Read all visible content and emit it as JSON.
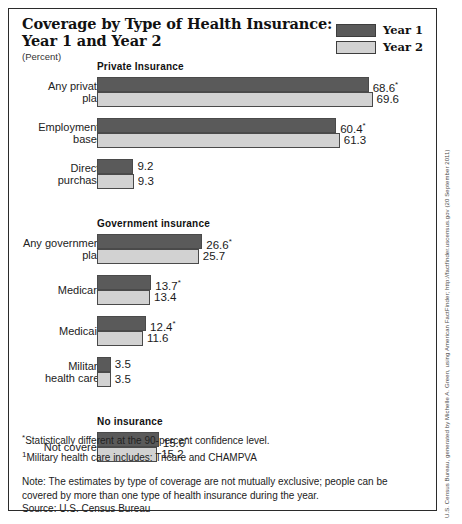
{
  "header": {
    "title_line1": "Coverage by Type of Health Insurance:",
    "title_line2": "Year 1 and Year 2",
    "subtitle": "(Percent)",
    "legend": [
      {
        "label": "Year 1",
        "color": "#5a5a5a"
      },
      {
        "label": "Year 2",
        "color": "#d2d2d2"
      }
    ]
  },
  "footnotes": [
    {
      "mark": "*",
      "text": "Statistically different at the 90-percent confidence level."
    },
    {
      "mark": "1",
      "text": "Military health care includes: Tricare and CHAMPVA"
    }
  ],
  "notes": {
    "note": "Note:  The estimates by type of coverage are not mutually exclusive; people can be covered by more than one type of health insurance during the year.",
    "source": "Source: U.S. Census Bureau"
  },
  "credit": "U.S. Census Bureau, generated by Michelle A. Green, using American FactFinder; http://factfinder.uscensus.gov (20 September 2011)",
  "chart_data": {
    "type": "bar",
    "title": "Coverage by Type of Health Insurance: Year 1 and Year 2",
    "subtitle": "(Percent)",
    "orientation": "horizontal",
    "xlabel": "Percent",
    "ylabel": "",
    "xlim": [
      0,
      70
    ],
    "grid": false,
    "legend_position": "top-right",
    "series": [
      {
        "name": "Year 1",
        "color": "#5a5a5a"
      },
      {
        "name": "Year 2",
        "color": "#d2d2d2"
      }
    ],
    "groups": [
      {
        "name": "Private Insurance",
        "categories": [
          {
            "label_lines": [
              "Any private",
              "plan"
            ],
            "values": [
              68.6,
              69.6
            ],
            "value_labels": [
              "68.6",
              "69.6"
            ],
            "significant": [
              true,
              false
            ]
          },
          {
            "label_lines": [
              "Employment-",
              "based"
            ],
            "values": [
              60.4,
              61.3
            ],
            "value_labels": [
              "60.4",
              "61.3"
            ],
            "significant": [
              true,
              false
            ]
          },
          {
            "label_lines": [
              "Direct-",
              "purchase"
            ],
            "values": [
              9.2,
              9.3
            ],
            "value_labels": [
              "9.2",
              "9.3"
            ],
            "significant": [
              false,
              false
            ]
          }
        ]
      },
      {
        "name": "Government insurance",
        "categories": [
          {
            "label_lines": [
              "Any government",
              "plan"
            ],
            "values": [
              26.6,
              25.7
            ],
            "value_labels": [
              "26.6",
              "25.7"
            ],
            "significant": [
              true,
              false
            ]
          },
          {
            "label_lines": [
              "Medicare"
            ],
            "values": [
              13.7,
              13.4
            ],
            "value_labels": [
              "13.7",
              "13.4"
            ],
            "significant": [
              true,
              false
            ]
          },
          {
            "label_lines": [
              "Medicaid"
            ],
            "values": [
              12.4,
              11.6
            ],
            "value_labels": [
              "12.4",
              "11.6"
            ],
            "significant": [
              true,
              false
            ]
          },
          {
            "label_lines": [
              "Military",
              "health care¹"
            ],
            "values": [
              3.5,
              3.5
            ],
            "value_labels": [
              "3.5",
              "3.5"
            ],
            "significant": [
              false,
              false
            ]
          }
        ]
      },
      {
        "name": "No insurance",
        "categories": [
          {
            "label_lines": [
              "Not covered"
            ],
            "values": [
              15.6,
              15.2
            ],
            "value_labels": [
              "15.6",
              "15.2"
            ],
            "significant": [
              true,
              false
            ]
          }
        ]
      }
    ]
  }
}
